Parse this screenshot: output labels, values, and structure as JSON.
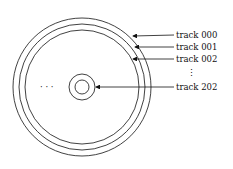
{
  "diagram": {
    "type": "disk-tracks",
    "labels": [
      {
        "id": "track-000",
        "text": "track 000",
        "y": 35
      },
      {
        "id": "track-001",
        "text": "track 001",
        "y": 47
      },
      {
        "id": "track-002",
        "text": "track 002",
        "y": 59
      },
      {
        "id": "track-202",
        "text": "track 202",
        "y": 87
      }
    ],
    "vertical_ellipsis": "⋮",
    "horizontal_ellipsis": "· · ·",
    "colors": {
      "line": "#111111",
      "background": "#ffffff"
    }
  }
}
